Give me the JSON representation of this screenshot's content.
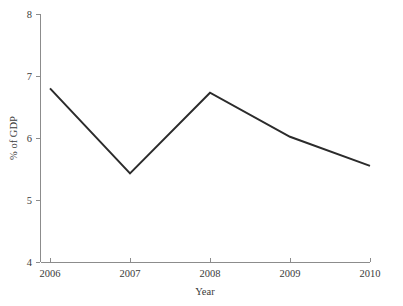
{
  "chart_data": {
    "type": "line",
    "title": "",
    "subtitle": "",
    "xlabel": "Year",
    "ylabel": "% of GDP",
    "x": [
      2006,
      2007,
      2008,
      2009,
      2010
    ],
    "categories": [
      "2006",
      "2007",
      "2008",
      "2009",
      "2010"
    ],
    "values": [
      6.8,
      5.43,
      6.73,
      6.02,
      5.55
    ],
    "series": [
      {
        "name": "% of GDP",
        "values": [
          6.8,
          5.43,
          6.73,
          6.02,
          5.55
        ]
      }
    ],
    "xlim": [
      2006,
      2010
    ],
    "ylim": [
      4,
      8
    ],
    "xticks": [
      "2006",
      "2007",
      "2008",
      "2009",
      "2010"
    ],
    "yticks": [
      "4",
      "5",
      "6",
      "7",
      "8"
    ],
    "grid": false,
    "legend": false,
    "legend_position": "none",
    "annotations": [],
    "line_color": "#2b2b2b",
    "axis_color": "#8c8c8c",
    "background_color": "#ffffff"
  },
  "axes": {
    "y_label": "% of GDP",
    "x_label": "Year",
    "y_tick_labels": [
      "8",
      "7",
      "6",
      "5",
      "4"
    ],
    "x_tick_labels": [
      "2006",
      "2007",
      "2008",
      "2009",
      "2010"
    ]
  }
}
